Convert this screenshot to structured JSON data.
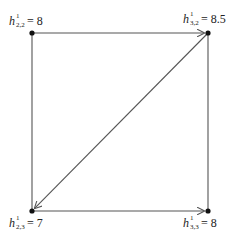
{
  "diagram": {
    "nodes": [
      {
        "id": "tl",
        "variable": "h",
        "superscript": "1",
        "subscript": "2,2",
        "equals": "=",
        "value": "8"
      },
      {
        "id": "tr",
        "variable": "h",
        "superscript": "1",
        "subscript": "3,2",
        "equals": "=",
        "value": "8.5"
      },
      {
        "id": "bl",
        "variable": "h",
        "superscript": "1",
        "subscript": "2,3",
        "equals": "=",
        "value": "7"
      },
      {
        "id": "br",
        "variable": "h",
        "superscript": "1",
        "subscript": "3,3",
        "equals": "=",
        "value": "8"
      }
    ],
    "edges": [
      {
        "from": "tl",
        "to": "tr",
        "directed": true
      },
      {
        "from": "bl",
        "to": "br",
        "directed": true
      },
      {
        "from": "tr",
        "to": "bl",
        "directed": true
      },
      {
        "from": "tl",
        "to": "bl",
        "directed": false
      },
      {
        "from": "tr",
        "to": "br",
        "directed": false
      }
    ],
    "colors": {
      "line": "#555555",
      "node": "#111111",
      "text": "#222222"
    }
  }
}
